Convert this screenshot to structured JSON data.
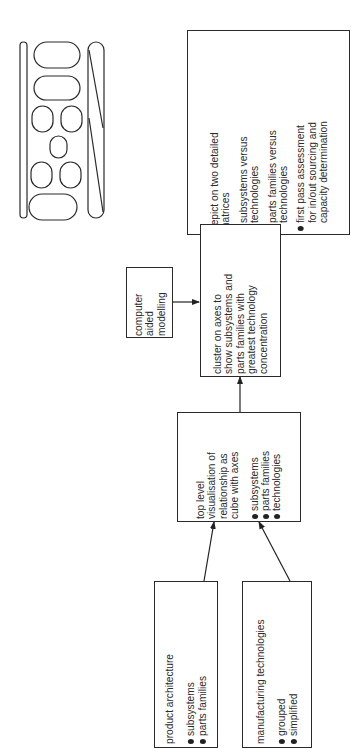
{
  "nodes": {
    "product_architecture": {
      "title": "product architecture",
      "bullets": [
        "subsystems",
        "parts families"
      ]
    },
    "manufacturing_technologies": {
      "title": "manufacturing technologies",
      "bullets": [
        "grouped",
        "simplified"
      ]
    },
    "top_level": {
      "title_lines": [
        "top level",
        "visualisation of",
        "relationship as",
        "cube with axes"
      ],
      "bullets": [
        "subsystems",
        "parts families",
        "technologies"
      ]
    },
    "computer_aided": {
      "title_lines": [
        "computer",
        "aided",
        "modelling"
      ]
    },
    "cluster": {
      "title_lines": [
        "cluster on axes to",
        "show subsystems and",
        "parts families with",
        "greatest technology",
        "concentration"
      ]
    },
    "matrices": {
      "title_lines": [
        "depict on two detailed",
        "matrices"
      ],
      "bullets": [
        [
          "subsystems versus",
          "technologies"
        ],
        [
          "parts families versus",
          "technologies"
        ],
        [
          "first pass assessment",
          "for in/out sourcing and",
          "capacity determination"
        ]
      ]
    }
  },
  "edges": [
    {
      "from": "product_architecture",
      "to": "top_level"
    },
    {
      "from": "manufacturing_technologies",
      "to": "top_level"
    },
    {
      "from": "top_level",
      "to": "cluster"
    },
    {
      "from": "computer_aided",
      "to": "cluster"
    },
    {
      "from": "cluster",
      "to": "matrices"
    }
  ],
  "sketch": {
    "label": "part layout sketch",
    "components": [
      "left-strip",
      "right-strip",
      "oval-wide",
      "oval-wide",
      "oval-small",
      "oval-small",
      "oval-center",
      "oval-small",
      "oval-small",
      "oval-wide"
    ]
  }
}
